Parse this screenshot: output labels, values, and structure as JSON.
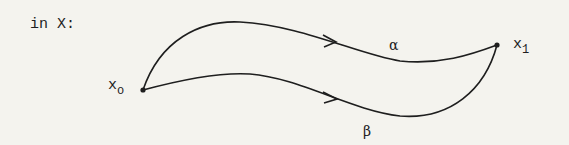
{
  "diagram": {
    "space_label": "in X:",
    "start_point": {
      "base": "x",
      "sub": "o"
    },
    "end_point": {
      "base": "x",
      "sub": "1"
    },
    "path_upper_label": "α",
    "path_lower_label": "β",
    "stroke_color": "#1e1e1e",
    "background_color": "#f4f3ee"
  }
}
